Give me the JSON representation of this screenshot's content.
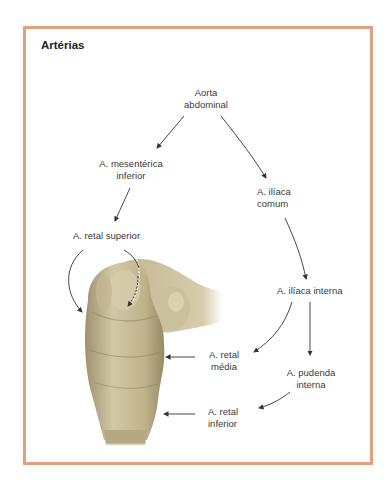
{
  "title": "Artérias",
  "colors": {
    "frame_border": "#e3a07c",
    "arrow": "#333333",
    "rectum_fill": "#c8bd98",
    "rectum_shade": "#9e9270"
  },
  "nodes": {
    "aorta": {
      "line1": "Aorta",
      "line2": "abdominal"
    },
    "mesenterica": {
      "line1": "A. mesentérica",
      "line2": "inferior"
    },
    "retal_superior": {
      "line1": "A. retal superior"
    },
    "iliaca_comum": {
      "line1": "A. ilíaca",
      "line2": "comum"
    },
    "iliaca_interna": {
      "line1": "A. ilíaca interna"
    },
    "retal_media": {
      "line1": "A. retal",
      "line2": "média"
    },
    "pudenda_interna": {
      "line1": "A. pudenda",
      "line2": "interna"
    },
    "retal_inferior": {
      "line1": "A. retal",
      "line2": "inferior"
    }
  },
  "edges": [
    {
      "from": "Aorta abdominal",
      "to": "A. mesentérica inferior"
    },
    {
      "from": "Aorta abdominal",
      "to": "A. ilíaca comum"
    },
    {
      "from": "A. mesentérica inferior",
      "to": "A. retal superior"
    },
    {
      "from": "A. ilíaca comum",
      "to": "A. ilíaca interna"
    },
    {
      "from": "A. ilíaca interna",
      "to": "A. retal média"
    },
    {
      "from": "A. ilíaca interna",
      "to": "A. pudenda interna"
    },
    {
      "from": "A. pudenda interna",
      "to": "A. retal inferior"
    },
    {
      "from": "A. retal superior",
      "to": "rectum (upper)"
    },
    {
      "from": "A. retal média",
      "to": "rectum (middle)"
    },
    {
      "from": "A. retal inferior",
      "to": "rectum (lower)"
    }
  ],
  "illustration": "rectum-sigmoid-illustration"
}
